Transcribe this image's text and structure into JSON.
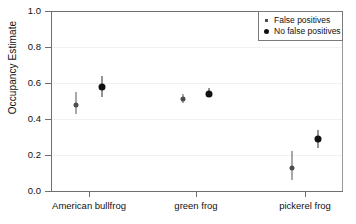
{
  "chart_data": {
    "type": "scatter",
    "title": "",
    "xlabel": "",
    "ylabel": "Occupancy Estimate",
    "ylim": [
      0.0,
      1.0
    ],
    "ytick_labels": [
      "0.0",
      "0.2",
      "0.4",
      "0.6",
      "0.8",
      "1.0"
    ],
    "ytick_values": [
      0.0,
      0.2,
      0.4,
      0.6,
      0.8,
      1.0
    ],
    "categories": [
      "American bullfrog",
      "green frog",
      "pickerel frog"
    ],
    "grid": true,
    "legend_position": "top-right",
    "legend": [
      {
        "label": "False positives",
        "marker": "square",
        "color": "#4d4d4d"
      },
      {
        "label": "No false positives",
        "marker": "circle",
        "color": "#111111"
      }
    ],
    "series": [
      {
        "name": "False positives",
        "color": "#4d4d4d",
        "marker": "square",
        "values": [
          0.48,
          0.51,
          0.13
        ],
        "ci_lower": [
          0.43,
          0.49,
          0.06
        ],
        "ci_upper": [
          0.55,
          0.54,
          0.22
        ]
      },
      {
        "name": "No false positives",
        "color": "#111111",
        "marker": "circle",
        "values": [
          0.58,
          0.54,
          0.29
        ],
        "ci_lower": [
          0.52,
          0.52,
          0.24
        ],
        "ci_upper": [
          0.64,
          0.57,
          0.34
        ]
      }
    ],
    "points": [
      {
        "category": "American bullfrog",
        "series": "False positives",
        "value": 0.48,
        "ci_lower": 0.43,
        "ci_upper": 0.55
      },
      {
        "category": "American bullfrog",
        "series": "No false positives",
        "value": 0.58,
        "ci_lower": 0.52,
        "ci_upper": 0.64
      },
      {
        "category": "green frog",
        "series": "False positives",
        "value": 0.51,
        "ci_lower": 0.49,
        "ci_upper": 0.54
      },
      {
        "category": "green frog",
        "series": "No false positives",
        "value": 0.54,
        "ci_lower": 0.52,
        "ci_upper": 0.57
      },
      {
        "category": "pickerel frog",
        "series": "False positives",
        "value": 0.13,
        "ci_lower": 0.06,
        "ci_upper": 0.22
      },
      {
        "category": "pickerel frog",
        "series": "No false positives",
        "value": 0.29,
        "ci_lower": 0.24,
        "ci_upper": 0.34
      }
    ]
  }
}
